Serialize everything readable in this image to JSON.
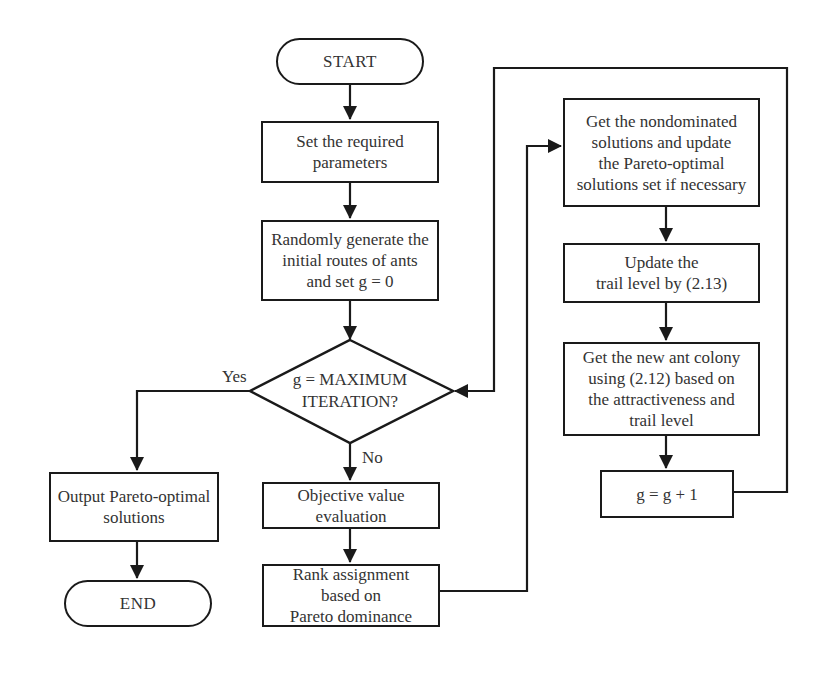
{
  "diagram": {
    "type": "flowchart",
    "nodes": {
      "start": {
        "shape": "terminal",
        "label": "START"
      },
      "set_params": {
        "shape": "process",
        "label": "Set the required\nparameters"
      },
      "random_init": {
        "shape": "process",
        "label": "Randomly generate the\ninitial routes of ants\nand set g = 0"
      },
      "decision": {
        "shape": "decision",
        "label": "g = MAXIMUM\nITERATION?"
      },
      "objective_eval": {
        "shape": "process",
        "label": "Objective value\nevaluation"
      },
      "rank_assign": {
        "shape": "process",
        "label": "Rank assignment\nbased on\nPareto dominance"
      },
      "output": {
        "shape": "process",
        "label": "Output Pareto-optimal\nsolutions"
      },
      "end": {
        "shape": "terminal",
        "label": "END"
      },
      "nondominated": {
        "shape": "process",
        "label": "Get the nondominated\nsolutions and update\nthe Pareto-optimal\nsolutions set if necessary"
      },
      "update_trail": {
        "shape": "process",
        "label": "Update the\ntrail level by (2.13)"
      },
      "new_colony": {
        "shape": "process",
        "label": "Get the new ant colony\nusing (2.12) based on\nthe attractiveness and\ntrail level"
      },
      "increment": {
        "shape": "process",
        "label": "g = g + 1"
      }
    },
    "edge_labels": {
      "yes": "Yes",
      "no": "No"
    },
    "edges": [
      {
        "from": "start",
        "to": "set_params"
      },
      {
        "from": "set_params",
        "to": "random_init"
      },
      {
        "from": "random_init",
        "to": "decision"
      },
      {
        "from": "decision",
        "to": "output",
        "label": "Yes"
      },
      {
        "from": "decision",
        "to": "objective_eval",
        "label": "No"
      },
      {
        "from": "output",
        "to": "end"
      },
      {
        "from": "objective_eval",
        "to": "rank_assign"
      },
      {
        "from": "rank_assign",
        "to": "nondominated"
      },
      {
        "from": "nondominated",
        "to": "update_trail"
      },
      {
        "from": "update_trail",
        "to": "new_colony"
      },
      {
        "from": "new_colony",
        "to": "increment"
      },
      {
        "from": "increment",
        "to": "decision"
      }
    ],
    "colors": {
      "stroke": "#1a1a1a",
      "text": "#333333",
      "background": "#ffffff"
    }
  }
}
